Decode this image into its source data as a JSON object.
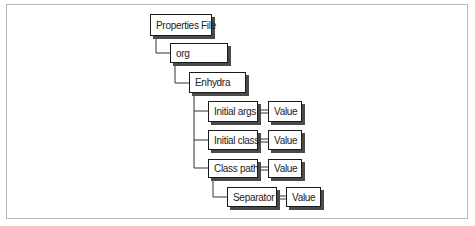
{
  "diagram": {
    "nodes": {
      "root": "Properties File",
      "org": "org",
      "enhydra": "Enhydra",
      "initial_args": "Initial args",
      "initial_args_value": "Value",
      "initial_class": "Initial class",
      "initial_class_value": "Value",
      "class_path": "Class path",
      "class_path_value": "Value",
      "separator": "Separator",
      "separator_value": "Value"
    },
    "colors": {
      "border": "#1a1a1a",
      "shadow": "#4a4a4a",
      "frame": "#b8b8b8"
    }
  }
}
